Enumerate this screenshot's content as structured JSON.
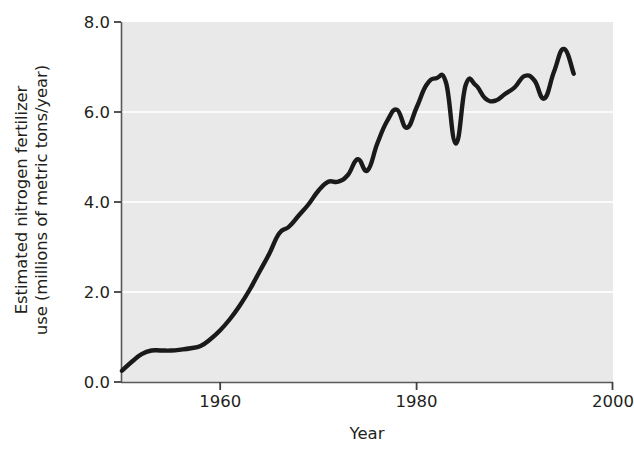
{
  "chart_data": {
    "type": "line",
    "title": "",
    "xlabel": "Year",
    "ylabel": "Estimated nitrogen fertilizer use (millions of metric tons/year)",
    "ylabel_line1": "Estimated nitrogen fertilizer",
    "ylabel_line2": "use (millions of metric tons/year)",
    "xlim": [
      1949.9,
      2000
    ],
    "ylim": [
      0.0,
      8.0
    ],
    "xticks": [
      1960,
      1980,
      2000
    ],
    "xtick_labels": [
      "1960",
      "1980",
      "2000"
    ],
    "yticks": [
      0.0,
      2.0,
      4.0,
      6.0,
      8.0
    ],
    "ytick_labels": [
      "0.0",
      "2.0",
      "4.0",
      "6.0",
      "8.0"
    ],
    "grid": "horizontal white gridlines at 2.0, 4.0 and 6.0",
    "legend": "none",
    "line_color": "#1a1a1a",
    "plot_background": "#e9e9e9",
    "figure_background": "#ffffff",
    "series": [
      {
        "name": "Estimated nitrogen fertilizer use",
        "units": "millions of metric tons per year",
        "x": [
          1950,
          1951,
          1952,
          1953,
          1954,
          1955,
          1956,
          1957,
          1958,
          1959,
          1960,
          1961,
          1962,
          1963,
          1964,
          1965,
          1966,
          1967,
          1968,
          1969,
          1970,
          1971,
          1972,
          1973,
          1974,
          1975,
          1976,
          1977,
          1978,
          1979,
          1980,
          1981,
          1982,
          1983,
          1984,
          1985,
          1986,
          1987,
          1988,
          1989,
          1990,
          1991,
          1992,
          1993,
          1994,
          1995,
          1996
        ],
        "values": [
          0.25,
          0.45,
          0.62,
          0.7,
          0.7,
          0.7,
          0.72,
          0.75,
          0.8,
          0.95,
          1.15,
          1.4,
          1.7,
          2.05,
          2.45,
          2.85,
          3.3,
          3.45,
          3.7,
          3.95,
          4.25,
          4.45,
          4.45,
          4.6,
          4.95,
          4.7,
          5.3,
          5.8,
          6.05,
          5.65,
          6.1,
          6.6,
          6.75,
          6.65,
          5.3,
          6.6,
          6.6,
          6.3,
          6.25,
          6.4,
          6.55,
          6.8,
          6.7,
          6.3,
          6.9,
          7.4,
          6.85
        ]
      }
    ]
  },
  "axis": {
    "y_tick_count": 5,
    "x_tick_count": 3
  }
}
